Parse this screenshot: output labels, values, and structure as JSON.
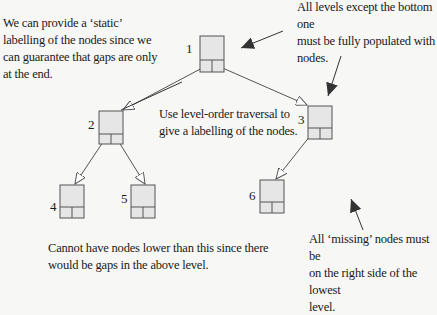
{
  "diagram": {
    "annotations": {
      "static_labelling": "We can provide a ‘static’\nlabelling of the nodes since we\ncan guarantee that gaps are only\nat the end.",
      "levels_full": "All levels except the bottom one\nmust be fully populated with\nnodes.",
      "level_order": "Use level-order traversal to\ngive a labelling of the nodes.",
      "no_lower_nodes": "Cannot have nodes lower than this since there\nwould be gaps in the above level.",
      "missing_right": "All ‘missing’ nodes must be\non the right side of the lowest\nlevel."
    },
    "nodes": [
      {
        "id": "1",
        "label": "1"
      },
      {
        "id": "2",
        "label": "2"
      },
      {
        "id": "3",
        "label": "3"
      },
      {
        "id": "4",
        "label": "4"
      },
      {
        "id": "5",
        "label": "5"
      },
      {
        "id": "6",
        "label": "6"
      }
    ],
    "edges": [
      {
        "from": "1",
        "to": "2"
      },
      {
        "from": "1",
        "to": "3"
      },
      {
        "from": "2",
        "to": "4"
      },
      {
        "from": "2",
        "to": "5"
      },
      {
        "from": "3",
        "to": "6"
      }
    ],
    "colors": {
      "node_fill": "#e6e6e6",
      "node_stroke": "#555555",
      "edge": "#555555",
      "pointer_arrow": "#333333"
    }
  }
}
